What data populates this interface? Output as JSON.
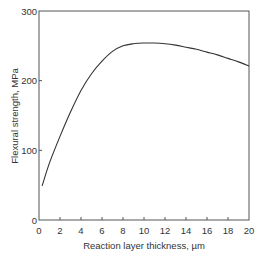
{
  "chart_data": {
    "type": "line",
    "title": "",
    "xlabel": "Reaction layer thickness, µm",
    "ylabel": "Flexural strength, MPa",
    "xlim": [
      0,
      20
    ],
    "ylim": [
      0,
      300
    ],
    "xticks": [
      0,
      2,
      4,
      6,
      8,
      10,
      12,
      14,
      16,
      18,
      20
    ],
    "yticks": [
      0,
      100,
      200,
      300
    ],
    "grid": false,
    "legend": "none",
    "series": [
      {
        "name": "Flexural strength",
        "x": [
          0.3,
          1,
          2,
          3,
          4,
          5,
          6,
          7,
          8,
          9,
          10,
          11,
          12,
          13,
          14,
          15,
          16,
          17,
          18,
          19,
          20
        ],
        "y": [
          49,
          82,
          120,
          155,
          186,
          210,
          228,
          242,
          250,
          253,
          254,
          254,
          253,
          251,
          248,
          245,
          241,
          237,
          232,
          227,
          221
        ]
      }
    ],
    "colors": {
      "line": "#333333",
      "axis": "#555555"
    }
  }
}
